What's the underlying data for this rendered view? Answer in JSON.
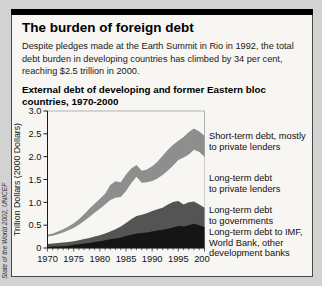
{
  "panel": {
    "title": "The burden of foreign debt",
    "intro": "Despite pledges made at the Earth Summit in Rio in 1992, the total debt burden in developing countries has climbed by 34 per cent, reaching $2.5 trillion in 2000.",
    "intro_lines": [
      "Despite pledges made at the Earth Summit in Rio in 1992, the total",
      "debt burden in developing countries has climbed by 34 per cent,",
      "reaching $2.5 trillion in 2000."
    ],
    "source": "State of the World 2002, UNICEF"
  },
  "chart_data": {
    "type": "area",
    "stacked": true,
    "title": "External debt of developing and former Eastern bloc countries, 1970-2000",
    "title_lines": [
      "External debt of developing and former Eastern bloc",
      "countries, 1970-2000"
    ],
    "ylabel": "Trillion Dollars (2000 Dollars)",
    "xlim": [
      1970,
      2000
    ],
    "ylim": [
      0,
      3.0
    ],
    "grid": false,
    "legend_position": "right",
    "x": [
      1970,
      1971,
      1972,
      1973,
      1974,
      1975,
      1976,
      1977,
      1978,
      1979,
      1980,
      1981,
      1982,
      1983,
      1984,
      1985,
      1986,
      1987,
      1988,
      1989,
      1990,
      1991,
      1992,
      1993,
      1994,
      1995,
      1996,
      1997,
      1998,
      1999,
      2000
    ],
    "x_tick_labels": [
      "1970",
      "1975",
      "1980",
      "1985",
      "1990",
      "1995",
      "2000"
    ],
    "y_ticks": [
      0,
      0.5,
      1.0,
      1.5,
      2.0,
      2.5,
      3.0
    ],
    "y_tick_labels": [
      "0",
      "0.5",
      "1.0",
      "1.5",
      "2.0",
      "2.5",
      "3.0"
    ],
    "series": [
      {
        "name": "long-term-imf",
        "label": "Long-term debt to IMF, World Bank, other development banks",
        "legend_lines": [
          "Long-term debt to IMF,",
          "World Bank, other",
          "development banks"
        ],
        "color": "#151515",
        "values": [
          0.02,
          0.03,
          0.03,
          0.04,
          0.05,
          0.07,
          0.08,
          0.1,
          0.11,
          0.13,
          0.15,
          0.17,
          0.19,
          0.21,
          0.23,
          0.26,
          0.29,
          0.32,
          0.33,
          0.34,
          0.36,
          0.38,
          0.4,
          0.42,
          0.45,
          0.48,
          0.47,
          0.5,
          0.53,
          0.5,
          0.46
        ]
      },
      {
        "name": "long-term-governments",
        "label": "Long-term debt to governments",
        "legend_lines": [
          "Long-term debt",
          "to governments"
        ],
        "color": "#545454",
        "values": [
          0.07,
          0.07,
          0.08,
          0.08,
          0.08,
          0.08,
          0.09,
          0.1,
          0.11,
          0.12,
          0.13,
          0.15,
          0.17,
          0.2,
          0.24,
          0.29,
          0.34,
          0.38,
          0.4,
          0.42,
          0.45,
          0.47,
          0.48,
          0.53,
          0.56,
          0.55,
          0.48,
          0.5,
          0.49,
          0.45,
          0.42
        ]
      },
      {
        "name": "long-term-private",
        "label": "Long-term debt to private lenders",
        "legend_lines": [
          "Long-term debt",
          "to private lenders"
        ],
        "color": "#f7f6f2",
        "values": [
          0.16,
          0.17,
          0.19,
          0.22,
          0.26,
          0.29,
          0.34,
          0.39,
          0.46,
          0.52,
          0.58,
          0.63,
          0.69,
          0.69,
          0.65,
          0.7,
          0.79,
          0.86,
          0.7,
          0.68,
          0.66,
          0.67,
          0.72,
          0.75,
          0.79,
          0.9,
          1.03,
          1.05,
          1.13,
          1.15,
          1.12
        ]
      },
      {
        "name": "short-term",
        "label": "Short-term debt, mostly to private lenders",
        "legend_lines": [
          "Short-term debt, mostly",
          "to private lenders"
        ],
        "color": "#8e8e8e",
        "values": [
          0.04,
          0.05,
          0.06,
          0.07,
          0.08,
          0.1,
          0.12,
          0.15,
          0.18,
          0.2,
          0.21,
          0.24,
          0.33,
          0.36,
          0.32,
          0.36,
          0.32,
          0.26,
          0.26,
          0.28,
          0.32,
          0.37,
          0.42,
          0.45,
          0.46,
          0.42,
          0.45,
          0.49,
          0.47,
          0.45,
          0.46
        ]
      }
    ],
    "colors": {
      "plot_border": "#b2b2b2",
      "axis": "#1a1a1a",
      "background": "#f7f6f2"
    }
  }
}
